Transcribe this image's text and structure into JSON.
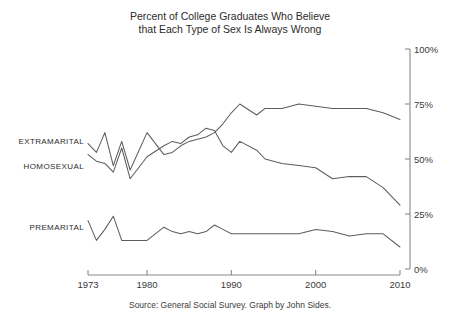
{
  "chart_data": {
    "type": "line",
    "title": "Percent of College Graduates Who Believe that Each Type of Sex Is Always Wrong",
    "title_line1": "Percent of College Graduates Who Believe",
    "title_line2": "that Each Type of Sex Is Always Wrong",
    "xlabel": "",
    "ylabel": "",
    "xlim": [
      1973,
      2010
    ],
    "ylim": [
      0,
      100
    ],
    "grid": false,
    "legend_position": "inline-left",
    "y_ticks": [
      0,
      25,
      50,
      75,
      100
    ],
    "y_ticklabels": [
      "0%",
      "25%",
      "50%",
      "75%",
      "100%"
    ],
    "y_axis_side": "right",
    "x_ticks": [
      1973,
      1980,
      1990,
      2000,
      2010
    ],
    "x_ticklabels": [
      "1973",
      "1980",
      "1990",
      "2000",
      "2010"
    ],
    "caption": "Source: General Social Survey.  Graph by John Sides.",
    "line_color": "#5d5d5d",
    "axis_color": "#8a8a8a",
    "background": "#ffffff",
    "series": [
      {
        "name": "EXTRAMARITAL",
        "label": "EXTRAMARITAL",
        "label_x": 1973,
        "label_y": 58,
        "x": [
          1973,
          1974,
          1975,
          1976,
          1977,
          1978,
          1980,
          1982,
          1983,
          1984,
          1985,
          1986,
          1987,
          1988,
          1989,
          1990,
          1991,
          1993,
          1994,
          1996,
          1998,
          2000,
          2002,
          2004,
          2006,
          2008,
          2010
        ],
        "values": [
          57,
          53,
          62,
          47,
          58,
          45,
          62,
          52,
          53,
          56,
          58,
          59,
          60,
          62,
          66,
          71,
          75,
          70,
          73,
          73,
          75,
          74,
          73,
          73,
          73,
          71,
          68
        ]
      },
      {
        "name": "HOMOSEXUAL",
        "label": "HOMOSEXUAL",
        "label_x": 1973,
        "label_y": 47,
        "x": [
          1973,
          1974,
          1975,
          1976,
          1977,
          1978,
          1980,
          1982,
          1983,
          1984,
          1985,
          1986,
          1987,
          1988,
          1989,
          1990,
          1991,
          1993,
          1994,
          1996,
          1998,
          2000,
          2002,
          2004,
          2006,
          2008,
          2010
        ],
        "values": [
          52,
          49,
          48,
          44,
          55,
          41,
          51,
          56,
          58,
          57,
          60,
          61,
          64,
          63,
          56,
          53,
          58,
          54,
          50,
          48,
          47,
          46,
          41,
          42,
          42,
          37,
          29
        ]
      },
      {
        "name": "PREMARITAL",
        "label": "PREMARITAL",
        "label_x": 1973,
        "label_y": 19,
        "x": [
          1973,
          1974,
          1975,
          1976,
          1977,
          1978,
          1980,
          1982,
          1983,
          1984,
          1985,
          1986,
          1987,
          1988,
          1989,
          1990,
          1991,
          1993,
          1994,
          1996,
          1998,
          2000,
          2002,
          2004,
          2006,
          2008,
          2010
        ],
        "values": [
          22,
          13,
          18,
          24,
          13,
          13,
          13,
          19,
          17,
          16,
          17,
          16,
          17,
          20,
          18,
          16,
          16,
          16,
          16,
          16,
          16,
          18,
          17,
          15,
          16,
          16,
          10
        ]
      }
    ]
  }
}
